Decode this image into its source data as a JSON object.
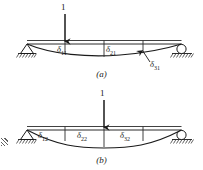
{
  "figure": {
    "type": "structural-beam-deflection-diagram",
    "panels": [
      {
        "id": "a",
        "caption": "(a)",
        "load": {
          "label": "1",
          "position_fraction": 0.28,
          "direction": "down"
        },
        "supports": [
          {
            "type": "pin",
            "side": "left"
          },
          {
            "type": "roller",
            "side": "right"
          }
        ],
        "deflection_labels": [
          {
            "text": "δ",
            "sub": "11"
          },
          {
            "text": "δ",
            "sub": "21"
          },
          {
            "text": "δ",
            "sub": "31"
          }
        ]
      },
      {
        "id": "b",
        "caption": "(b)",
        "load": {
          "label": "1",
          "position_fraction": 0.5,
          "direction": "down"
        },
        "supports": [
          {
            "type": "pin",
            "side": "left"
          },
          {
            "type": "roller",
            "side": "right"
          }
        ],
        "deflection_labels": [
          {
            "text": "δ",
            "sub": "12"
          },
          {
            "text": "δ",
            "sub": "22"
          },
          {
            "text": "δ",
            "sub": "32"
          }
        ]
      }
    ],
    "colors": {
      "ink": "#1a1a1a",
      "beam": "#2b2b2b",
      "hatch": "#3a3a3a",
      "background": "#ffffff"
    }
  }
}
